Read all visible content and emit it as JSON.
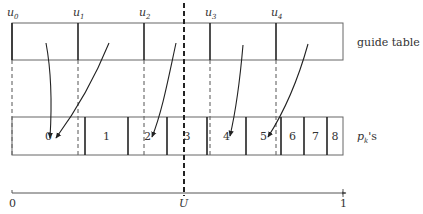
{
  "guide_table": {
    "label": "guide table",
    "markers": [
      {
        "base": "u",
        "sub": "0",
        "x": 12
      },
      {
        "base": "u",
        "sub": "1",
        "x": 78
      },
      {
        "base": "u",
        "sub": "2",
        "x": 144
      },
      {
        "base": "u",
        "sub": "3",
        "x": 210
      },
      {
        "base": "u",
        "sub": "4",
        "x": 276
      }
    ],
    "right_edge": 343
  },
  "pk_row": {
    "label_base": "p",
    "label_sub": "k",
    "label_suffix": "'s",
    "cells": [
      {
        "label": "0",
        "x0": 12,
        "x1": 85
      },
      {
        "label": "1",
        "x0": 85,
        "x1": 128
      },
      {
        "label": "2",
        "x0": 128,
        "x1": 167
      },
      {
        "label": "3",
        "x0": 167,
        "x1": 207
      },
      {
        "label": "4",
        "x0": 207,
        "x1": 246
      },
      {
        "label": "5",
        "x0": 246,
        "x1": 281
      },
      {
        "label": "6",
        "x0": 281,
        "x1": 304
      },
      {
        "label": "7",
        "x0": 304,
        "x1": 327
      },
      {
        "label": "8",
        "x0": 327,
        "x1": 343
      }
    ]
  },
  "axis": {
    "start_label": "0",
    "end_label": "1",
    "marker_label": "U",
    "marker_x": 184
  },
  "colors": {
    "line": "#555555",
    "bold_line": "#222222",
    "text": "#333333",
    "background": "#ffffff"
  }
}
